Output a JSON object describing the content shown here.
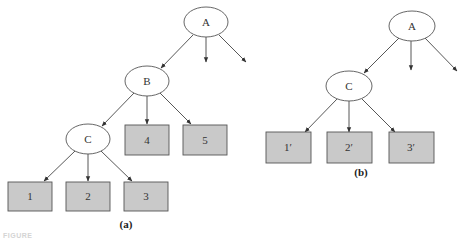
{
  "figure": {
    "caption_fragment": "FIGURE",
    "colors": {
      "background": "#ffffff",
      "edge": "#444444",
      "ellipse_fill": "#ffffff",
      "ellipse_stroke": "#555555",
      "box_fill": "#c9c9c9",
      "box_stroke": "#555555"
    },
    "panel_a": {
      "label": "(a)",
      "nodes": {
        "A": {
          "label": "A",
          "shape": "ellipse"
        },
        "B": {
          "label": "B",
          "shape": "ellipse"
        },
        "C": {
          "label": "C",
          "shape": "ellipse"
        },
        "n1": {
          "label": "1",
          "shape": "box"
        },
        "n2": {
          "label": "2",
          "shape": "box"
        },
        "n3": {
          "label": "3",
          "shape": "box"
        },
        "n4": {
          "label": "4",
          "shape": "box"
        },
        "n5": {
          "label": "5",
          "shape": "box"
        }
      },
      "edges": [
        [
          "A",
          "B"
        ],
        [
          "A",
          "(unlabeled)"
        ],
        [
          "A",
          "(unlabeled)"
        ],
        [
          "B",
          "C"
        ],
        [
          "B",
          "4"
        ],
        [
          "B",
          "5"
        ],
        [
          "C",
          "1"
        ],
        [
          "C",
          "2"
        ],
        [
          "C",
          "3"
        ]
      ]
    },
    "panel_b": {
      "label": "(b)",
      "nodes": {
        "A": {
          "label": "A",
          "shape": "ellipse"
        },
        "C": {
          "label": "C",
          "shape": "ellipse"
        },
        "n1": {
          "label": "1′",
          "shape": "box"
        },
        "n2": {
          "label": "2′",
          "shape": "box"
        },
        "n3": {
          "label": "3′",
          "shape": "box"
        }
      },
      "edges": [
        [
          "A",
          "C"
        ],
        [
          "A",
          "(unlabeled)"
        ],
        [
          "A",
          "(unlabeled)"
        ],
        [
          "C",
          "1′"
        ],
        [
          "C",
          "2′"
        ],
        [
          "C",
          "3′"
        ]
      ]
    }
  }
}
